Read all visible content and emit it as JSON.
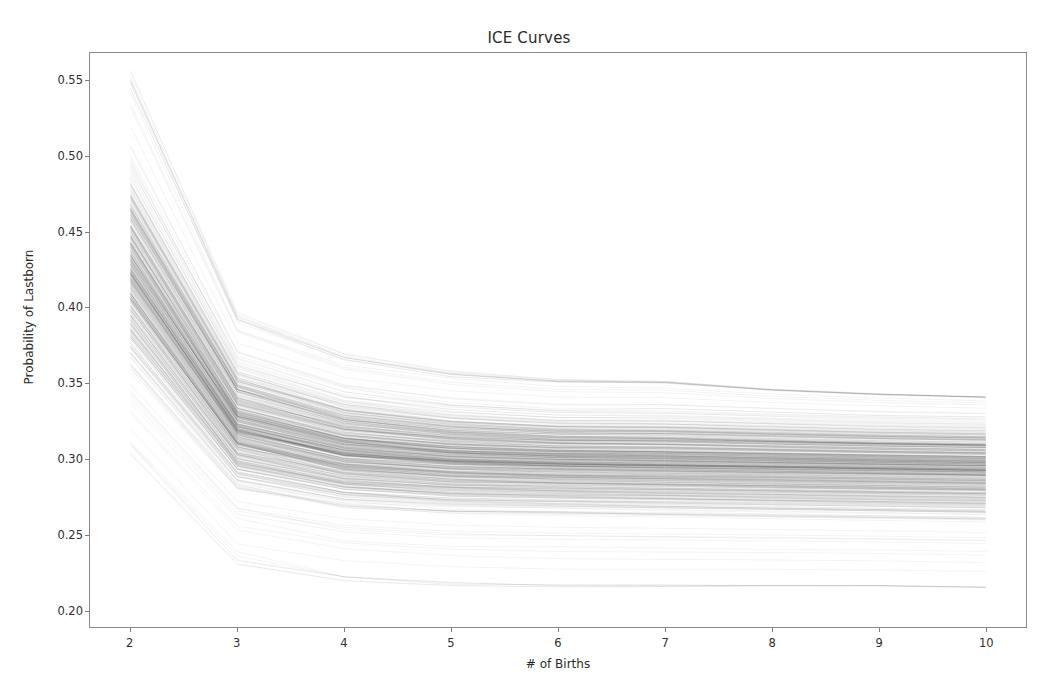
{
  "figure": {
    "title": "ICE Curves",
    "background_color": "#ffffff",
    "axes_color": "#8a8a8a",
    "line_color": "#000000"
  },
  "axes": {
    "xlabel": "# of Births",
    "ylabel": "Probability of Lastborn",
    "xticks": [
      "2",
      "3",
      "4",
      "5",
      "6",
      "7",
      "8",
      "9",
      "10"
    ],
    "yticks": [
      "0.20",
      "0.25",
      "0.30",
      "0.35",
      "0.40",
      "0.45",
      "0.50",
      "0.55"
    ],
    "xlim": [
      1.62,
      10.38
    ],
    "ylim": [
      0.1885,
      0.5685
    ],
    "grid": "off",
    "legend": "none"
  },
  "chart_data": {
    "type": "line",
    "title": "ICE Curves",
    "xlabel": "# of Births",
    "ylabel": "Probability of Lastborn",
    "x": [
      2,
      3,
      4,
      5,
      6,
      7,
      8,
      9,
      10
    ],
    "xlim": [
      1.62,
      10.38
    ],
    "ylim": [
      0.1885,
      0.5685
    ],
    "grid": false,
    "legend_position": "none",
    "note": "Individual Conditional Expectation curves: ~500 near-monotone decreasing lines drawn with low alpha; steep drop from x=2 to x=3, then flattening to near-constant values by x=6.",
    "n_curves": 500,
    "envelope": {
      "max": [
        0.553,
        0.394,
        0.368,
        0.357,
        0.352,
        0.351,
        0.346,
        0.343,
        0.341
      ],
      "q90": [
        0.497,
        0.367,
        0.345,
        0.336,
        0.332,
        0.332,
        0.33,
        0.328,
        0.327
      ],
      "median": [
        0.425,
        0.321,
        0.305,
        0.3,
        0.298,
        0.297,
        0.296,
        0.295,
        0.294
      ],
      "q10": [
        0.356,
        0.278,
        0.266,
        0.262,
        0.261,
        0.26,
        0.259,
        0.258,
        0.257
      ],
      "min": [
        0.307,
        0.233,
        0.22,
        0.216,
        0.215,
        0.215,
        0.215,
        0.215,
        0.214
      ]
    },
    "series": [
      {
        "name": "curve-high-1",
        "values": [
          0.553,
          0.394,
          0.368,
          0.357,
          0.352,
          0.351,
          0.346,
          0.343,
          0.341
        ]
      },
      {
        "name": "curve-high-2",
        "values": [
          0.534,
          0.386,
          0.361,
          0.351,
          0.347,
          0.346,
          0.342,
          0.34,
          0.338
        ]
      },
      {
        "name": "curve-high-3",
        "values": [
          0.517,
          0.379,
          0.355,
          0.346,
          0.342,
          0.341,
          0.338,
          0.336,
          0.334
        ]
      },
      {
        "name": "curve-mid-1",
        "values": [
          0.47,
          0.355,
          0.334,
          0.327,
          0.324,
          0.323,
          0.321,
          0.32,
          0.318
        ]
      },
      {
        "name": "curve-mid-2",
        "values": [
          0.425,
          0.321,
          0.305,
          0.3,
          0.298,
          0.297,
          0.296,
          0.295,
          0.294
        ]
      },
      {
        "name": "curve-mid-3",
        "values": [
          0.392,
          0.3,
          0.287,
          0.283,
          0.281,
          0.281,
          0.28,
          0.279,
          0.278
        ]
      },
      {
        "name": "curve-low-1",
        "values": [
          0.356,
          0.278,
          0.266,
          0.262,
          0.261,
          0.26,
          0.259,
          0.258,
          0.257
        ]
      },
      {
        "name": "curve-low-2",
        "values": [
          0.33,
          0.253,
          0.24,
          0.236,
          0.235,
          0.235,
          0.234,
          0.234,
          0.233
        ]
      },
      {
        "name": "curve-low-3",
        "values": [
          0.307,
          0.233,
          0.22,
          0.216,
          0.215,
          0.215,
          0.215,
          0.215,
          0.214
        ]
      }
    ]
  }
}
